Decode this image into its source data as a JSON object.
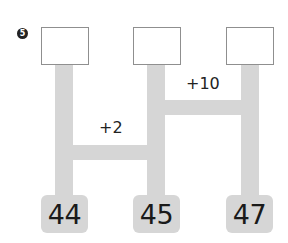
{
  "problem": {
    "number_badge": "5",
    "answer_boxes": [
      "",
      "",
      ""
    ],
    "rungs": [
      {
        "label": "+10",
        "connects": [
          "middle",
          "right"
        ]
      },
      {
        "label": "+2",
        "connects": [
          "left",
          "middle"
        ]
      }
    ],
    "bottom_numbers": [
      "44",
      "45",
      "47"
    ]
  },
  "colors": {
    "rail": "#d6d6d6",
    "box_border": "#8f8f8f",
    "text": "#1a1a1a"
  }
}
